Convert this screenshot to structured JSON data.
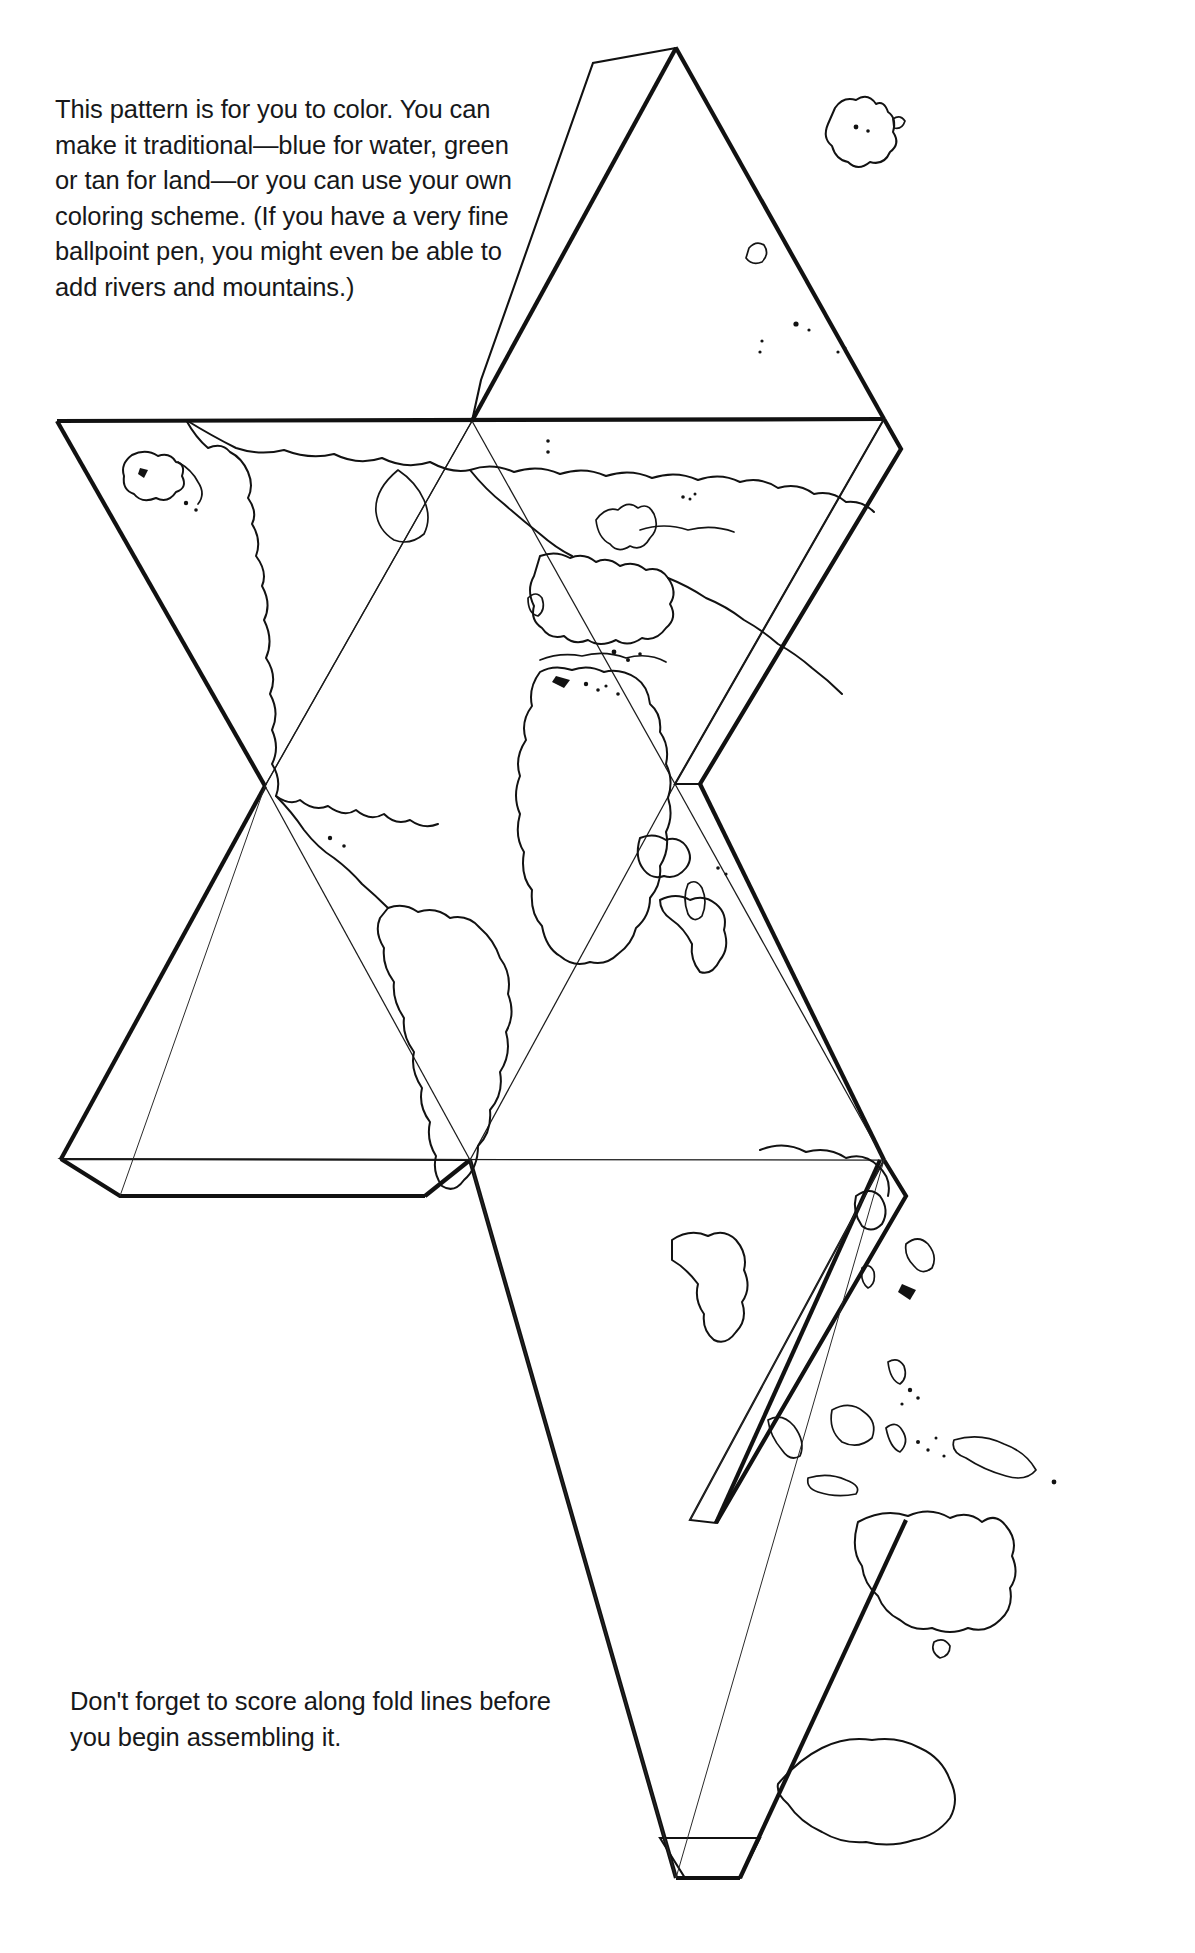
{
  "document": {
    "title": "Icosahedron Globe Pattern",
    "page_background": "#ffffff",
    "ink_color": "#111111",
    "width": 1195,
    "height": 1953
  },
  "intro": {
    "text": "This pattern is for you to color.  You can make it traditional—blue for water, green or tan for land—or you can use your own coloring scheme. (If you have a very fine ballpoint pen, you might even be able to add rivers and mountains.)"
  },
  "closing": {
    "text": "Don't forget to score along fold lines before you begin assembling it."
  },
  "net": {
    "solid": "icosahedron",
    "face_count": 20,
    "projection": "gnomonic-icosahedral",
    "glue_tab_count": 5,
    "line_styles": {
      "cut_edge": "heavy",
      "fold_line": "light",
      "coastline": "medium"
    },
    "features": [
      "North America",
      "Greenland",
      "South America",
      "Europe",
      "Africa",
      "Asia",
      "Indonesia",
      "Philippines",
      "Japan",
      "Australia",
      "New Zealand",
      "Antarctica",
      "Equator line"
    ]
  }
}
